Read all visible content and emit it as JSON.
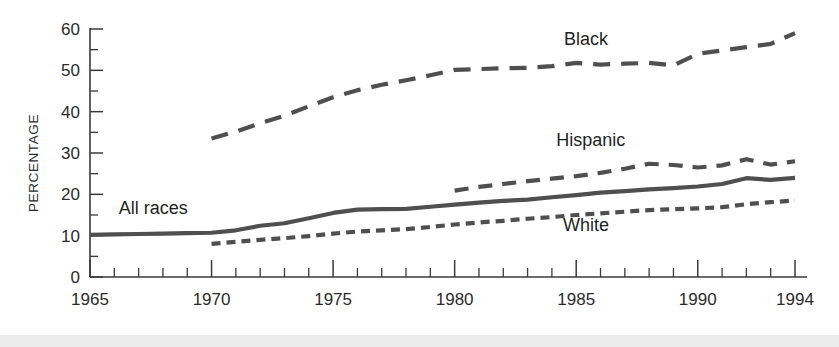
{
  "chart_data": {
    "type": "line",
    "title": "",
    "subtitle": "",
    "xlabel": "",
    "ylabel": "PERCENTAGE",
    "xlim": [
      1965,
      1994
    ],
    "ylim": [
      0,
      60
    ],
    "grid": false,
    "legend_position": "inline-labels",
    "x_tick_labels": [
      "1965",
      "1970",
      "1975",
      "1980",
      "1985",
      "1990",
      "1994"
    ],
    "x_tick_values": [
      1965,
      1970,
      1975,
      1980,
      1985,
      1990,
      1994
    ],
    "x_minor_tick_interval": 1,
    "y_tick_labels": [
      "0",
      "10",
      "20",
      "30",
      "40",
      "50",
      "60"
    ],
    "y_tick_values": [
      0,
      10,
      20,
      30,
      40,
      50,
      60
    ],
    "y_minor_tick_values": [
      5,
      15,
      25,
      35,
      45,
      55
    ],
    "line_color": "#4f4f4f",
    "axis_color": "#3a3a3a",
    "series": [
      {
        "name": "All races",
        "label": "All races",
        "style": "solid",
        "dasharray": "none",
        "label_x": 1967.6,
        "label_y": 15.3,
        "x": [
          1965,
          1966,
          1967,
          1968,
          1969,
          1970,
          1971,
          1972,
          1973,
          1974,
          1975,
          1976,
          1977,
          1978,
          1979,
          1980,
          1981,
          1982,
          1983,
          1984,
          1985,
          1986,
          1987,
          1988,
          1989,
          1990,
          1991,
          1992,
          1993,
          1994
        ],
        "values": [
          10.2,
          10.3,
          10.4,
          10.5,
          10.6,
          10.7,
          11.3,
          12.4,
          13.0,
          14.2,
          15.5,
          16.3,
          16.4,
          16.5,
          17.0,
          17.5,
          18.0,
          18.4,
          18.7,
          19.3,
          19.8,
          20.4,
          20.8,
          21.2,
          21.5,
          21.9,
          22.5,
          23.9,
          23.5,
          24.0
        ]
      },
      {
        "name": "Black",
        "label": "Black",
        "style": "long-dash",
        "dasharray": "17 11",
        "label_x": 1985.4,
        "label_y": 56.2,
        "x": [
          1970,
          1971,
          1972,
          1973,
          1974,
          1975,
          1976,
          1977,
          1978,
          1979,
          1980,
          1981,
          1982,
          1983,
          1984,
          1985,
          1986,
          1987,
          1988,
          1989,
          1990,
          1991,
          1992,
          1993,
          1994
        ],
        "values": [
          33.5,
          35.2,
          37.2,
          39.0,
          41.3,
          43.5,
          45.2,
          46.5,
          47.6,
          48.8,
          50.1,
          50.3,
          50.5,
          50.6,
          51.0,
          51.8,
          51.4,
          51.6,
          51.8,
          51.2,
          54.0,
          54.8,
          55.6,
          56.4,
          59.0
        ]
      },
      {
        "name": "Hispanic",
        "label": "Hispanic",
        "style": "medium-dash",
        "dasharray": "14 10",
        "label_x": 1985.6,
        "label_y": 31.8,
        "x": [
          1980,
          1981,
          1982,
          1983,
          1984,
          1985,
          1986,
          1987,
          1988,
          1989,
          1990,
          1991,
          1992,
          1993,
          1994
        ],
        "values": [
          20.9,
          21.8,
          22.5,
          23.2,
          23.8,
          24.4,
          25.2,
          26.2,
          27.4,
          27.1,
          26.5,
          27.0,
          28.5,
          27.2,
          28.0
        ]
      },
      {
        "name": "White",
        "label": "White",
        "style": "short-dash",
        "dasharray": "9 6",
        "label_x": 1985.4,
        "label_y": 11.2,
        "x": [
          1970,
          1971,
          1972,
          1973,
          1974,
          1975,
          1976,
          1977,
          1978,
          1979,
          1980,
          1981,
          1982,
          1983,
          1984,
          1985,
          1986,
          1987,
          1988,
          1989,
          1990,
          1991,
          1992,
          1993,
          1994
        ],
        "values": [
          8.0,
          8.5,
          9.0,
          9.4,
          9.9,
          10.5,
          11.0,
          11.3,
          11.6,
          12.1,
          12.7,
          13.2,
          13.6,
          14.1,
          14.5,
          15.0,
          15.4,
          15.8,
          16.2,
          16.4,
          16.6,
          16.9,
          17.6,
          18.1,
          18.5
        ]
      }
    ]
  }
}
